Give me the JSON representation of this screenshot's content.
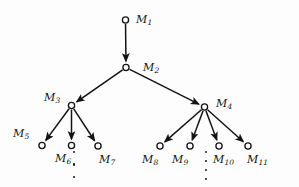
{
  "figure": {
    "type": "tree-diagram",
    "title": "",
    "background_color": "#fdfdfd",
    "stroke_color": "#141414",
    "node_fill": "#fdfdfd",
    "node_radius": 3.1
  },
  "nodes": [
    {
      "id": "M1",
      "base": "M",
      "sub": "1",
      "cx": 125.5,
      "cy": 20.0,
      "label_x": 136,
      "label_y": 13.5
    },
    {
      "id": "M2",
      "base": "M",
      "sub": "2",
      "cx": 126.0,
      "cy": 67.5,
      "label_x": 143,
      "label_y": 62.0
    },
    {
      "id": "M3",
      "base": "M",
      "sub": "3",
      "cx": 71.5,
      "cy": 105.5,
      "label_x": 44,
      "label_y": 92.0
    },
    {
      "id": "M4",
      "base": "M",
      "sub": "4",
      "cx": 204.5,
      "cy": 107.0,
      "label_x": 216,
      "label_y": 97.5
    },
    {
      "id": "M5",
      "base": "M",
      "sub": "5",
      "cx": 42.0,
      "cy": 145.5,
      "label_x": 13,
      "label_y": 127.5
    },
    {
      "id": "M6",
      "base": "M",
      "sub": "6",
      "cx": 71.5,
      "cy": 145.5,
      "label_x": 55,
      "label_y": 153.0
    },
    {
      "id": "M7",
      "base": "M",
      "sub": "7",
      "cx": 98.0,
      "cy": 146.0,
      "label_x": 99,
      "label_y": 153.5
    },
    {
      "id": "M8",
      "base": "M",
      "sub": "8",
      "cx": 160.0,
      "cy": 146.0,
      "label_x": 142,
      "label_y": 154.0
    },
    {
      "id": "M9",
      "base": "M",
      "sub": "9",
      "cx": 190.0,
      "cy": 146.0,
      "label_x": 172,
      "label_y": 154.0
    },
    {
      "id": "M10",
      "base": "M",
      "sub": "10",
      "cx": 219.0,
      "cy": 146.0,
      "label_x": 213,
      "label_y": 154.0
    },
    {
      "id": "M11",
      "base": "M",
      "sub": "11",
      "cx": 248.0,
      "cy": 146.0,
      "label_x": 247,
      "label_y": 154.0
    }
  ],
  "edges": [
    {
      "from": "M1",
      "to": "M2"
    },
    {
      "from": "M2",
      "to": "M3"
    },
    {
      "from": "M2",
      "to": "M4"
    },
    {
      "from": "M3",
      "to": "M5"
    },
    {
      "from": "M3",
      "to": "M6"
    },
    {
      "from": "M3",
      "to": "M7"
    },
    {
      "from": "M4",
      "to": "M8"
    },
    {
      "from": "M4",
      "to": "M9"
    },
    {
      "from": "M4",
      "to": "M10"
    },
    {
      "from": "M4",
      "to": "M11"
    }
  ],
  "ellipses": [
    {
      "id": "left-vertical-dots",
      "x": 72.5,
      "y": 151.0,
      "height": 27.0,
      "dots": 3
    },
    {
      "id": "right-vertical-dots",
      "x": 204.5,
      "y": 151.0,
      "height": 29.0,
      "dots": 4
    }
  ]
}
